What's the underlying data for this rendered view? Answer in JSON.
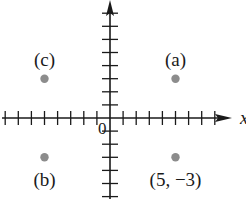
{
  "chart_data": {
    "type": "scatter",
    "title": "",
    "xlabel": "x",
    "ylabel": "",
    "origin_label": "0",
    "grid": false,
    "xlim": [
      -8,
      9
    ],
    "ylim": [
      -5,
      9
    ],
    "x_tick_step": 1,
    "y_tick_step": 1,
    "points": [
      {
        "label": "(a)",
        "x": 5,
        "y": 3
      },
      {
        "label": "(b)",
        "x": -5,
        "y": -3
      },
      {
        "label": "(c)",
        "x": -5,
        "y": 3
      },
      {
        "label": "(5, −3)",
        "x": 5,
        "y": -3
      }
    ],
    "point_color": "#8c8c8c",
    "axis_color": "#1a1a1a"
  }
}
